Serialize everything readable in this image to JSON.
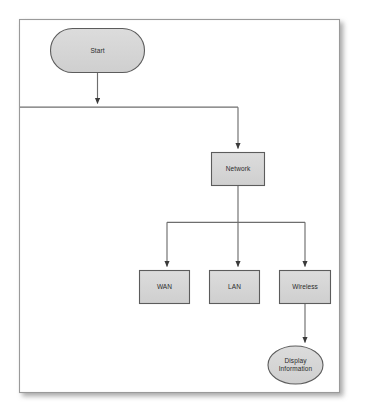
{
  "diagram": {
    "type": "flowchart",
    "canvas": {
      "width": 370,
      "height": 418,
      "background": "#ffffff"
    },
    "frame": {
      "name": "diagram-frame",
      "x": 19,
      "y": 19,
      "width": 321,
      "height": 374,
      "fill": "#ffffff",
      "border_color": "#9a9a9a",
      "shadow_color": "#b8b8b8"
    },
    "style": {
      "node_fill": "#d5d5d5",
      "node_stroke": "#5c5c5c",
      "connector_color": "#6e6e6e",
      "text_color": "#2b2b2b"
    },
    "nodes": [
      {
        "id": "start",
        "label": "Start",
        "shape": "stadium",
        "x": 50,
        "y": 28,
        "width": 95,
        "height": 45
      },
      {
        "id": "network",
        "label": "Network",
        "shape": "rectangle",
        "x": 211,
        "y": 152,
        "width": 54,
        "height": 34
      },
      {
        "id": "wan",
        "label": "WAN",
        "shape": "rectangle",
        "x": 139,
        "y": 270,
        "width": 51,
        "height": 34
      },
      {
        "id": "lan",
        "label": "LAN",
        "shape": "rectangle",
        "x": 209,
        "y": 270,
        "width": 51,
        "height": 34
      },
      {
        "id": "wireless",
        "label": "Wireless",
        "shape": "rectangle",
        "x": 279,
        "y": 270,
        "width": 52,
        "height": 34
      },
      {
        "id": "display_information",
        "label": "Display\nInformation",
        "shape": "ellipse",
        "x": 268,
        "y": 346,
        "width": 55,
        "height": 38
      }
    ],
    "edges": [
      {
        "id": "start-to-bus",
        "from": "start",
        "to": "main-bus",
        "arrow": true
      },
      {
        "id": "bus-to-network",
        "from": "main-bus",
        "to": "network",
        "arrow": true
      },
      {
        "id": "network-to-branch",
        "from": "network",
        "to": "branch-bus",
        "arrow": false
      },
      {
        "id": "branch-to-wan",
        "from": "branch-bus",
        "to": "wan",
        "arrow": true
      },
      {
        "id": "branch-to-lan",
        "from": "branch-bus",
        "to": "lan",
        "arrow": true
      },
      {
        "id": "branch-to-wireless",
        "from": "branch-bus",
        "to": "wireless",
        "arrow": true
      },
      {
        "id": "wireless-to-display",
        "from": "wireless",
        "to": "display_information",
        "arrow": true
      }
    ]
  }
}
